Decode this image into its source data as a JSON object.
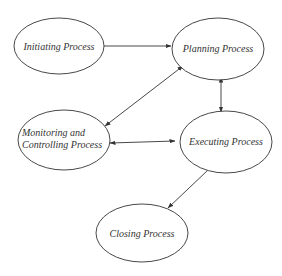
{
  "diagram": {
    "type": "process-flow",
    "nodes": [
      {
        "id": "initiating",
        "label_lines": [
          "Initiating Process"
        ],
        "cx": 59,
        "cy": 46,
        "rx": 45,
        "ry": 28
      },
      {
        "id": "planning",
        "label_lines": [
          "Planning Process"
        ],
        "cx": 218,
        "cy": 49,
        "rx": 46,
        "ry": 33
      },
      {
        "id": "monitoring",
        "label_lines": [
          "Monitoring and",
          "Controlling Process"
        ],
        "cx": 64,
        "cy": 140,
        "rx": 46,
        "ry": 30
      },
      {
        "id": "executing",
        "label_lines": [
          "Executing Process"
        ],
        "cx": 226,
        "cy": 142,
        "rx": 46,
        "ry": 34
      },
      {
        "id": "closing",
        "label_lines": [
          "Closing Process"
        ],
        "cx": 142,
        "cy": 233,
        "rx": 46,
        "ry": 29
      }
    ],
    "edges": [
      {
        "from": "initiating",
        "to": "planning",
        "direction": "one-way"
      },
      {
        "from": "planning",
        "to": "monitoring",
        "direction": "two-way"
      },
      {
        "from": "planning",
        "to": "executing",
        "direction": "two-way"
      },
      {
        "from": "monitoring",
        "to": "executing",
        "direction": "two-way"
      },
      {
        "from": "executing",
        "to": "closing",
        "direction": "one-way"
      }
    ],
    "colors": {
      "stroke": "#333333",
      "text": "#333333",
      "background": "#ffffff"
    }
  }
}
